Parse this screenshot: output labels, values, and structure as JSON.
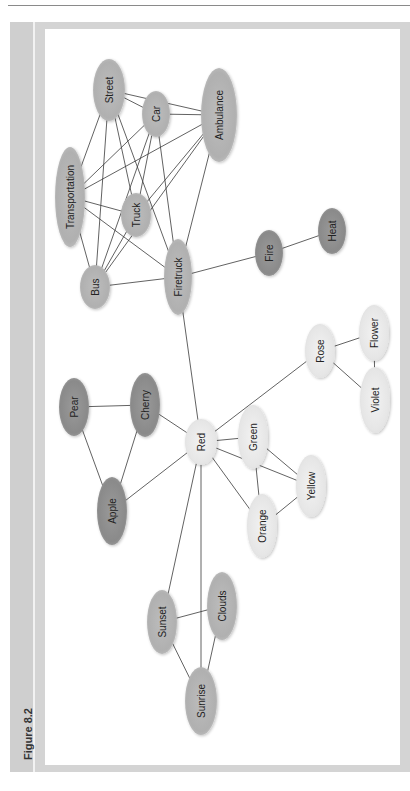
{
  "figure": {
    "title": "Figure 8.2"
  },
  "colors": {
    "frame": "#d4d4d4",
    "dark_node": "#8c8c8c",
    "medium_node": "#b4b4b4",
    "light_node": "#e8e8e8",
    "edge": "#3a3a3a"
  },
  "diagram": {
    "nodes": [
      {
        "id": "street",
        "label": "Street",
        "cx": 109,
        "cy": 90,
        "rx": 16,
        "ry": 31,
        "tone": "medium"
      },
      {
        "id": "car",
        "label": "Car",
        "cx": 156,
        "cy": 114,
        "rx": 14,
        "ry": 23,
        "tone": "medium"
      },
      {
        "id": "ambulance",
        "label": "Ambulance",
        "cx": 219,
        "cy": 115,
        "rx": 18,
        "ry": 47,
        "tone": "medium"
      },
      {
        "id": "transportation",
        "label": "Transportation",
        "cx": 70,
        "cy": 197,
        "rx": 15,
        "ry": 50,
        "tone": "medium"
      },
      {
        "id": "truck",
        "label": "Truck",
        "cx": 136,
        "cy": 215,
        "rx": 15,
        "ry": 22,
        "tone": "medium"
      },
      {
        "id": "bus",
        "label": "Bus",
        "cx": 95,
        "cy": 287,
        "rx": 15,
        "ry": 22,
        "tone": "medium"
      },
      {
        "id": "firetruck",
        "label": "Firetruck",
        "cx": 178,
        "cy": 277,
        "rx": 14,
        "ry": 38,
        "tone": "medium"
      },
      {
        "id": "fire",
        "label": "Fire",
        "cx": 269,
        "cy": 253,
        "rx": 14,
        "ry": 23,
        "tone": "dark"
      },
      {
        "id": "heat",
        "label": "Heat",
        "cx": 332,
        "cy": 231,
        "rx": 14,
        "ry": 23,
        "tone": "dark"
      },
      {
        "id": "rose",
        "label": "Rose",
        "cx": 320,
        "cy": 351,
        "rx": 15,
        "ry": 27,
        "tone": "light"
      },
      {
        "id": "flower",
        "label": "Flower",
        "cx": 374,
        "cy": 333,
        "rx": 15,
        "ry": 28,
        "tone": "light"
      },
      {
        "id": "violet",
        "label": "Violet",
        "cx": 375,
        "cy": 400,
        "rx": 15,
        "ry": 33,
        "tone": "light"
      },
      {
        "id": "pear",
        "label": "Pear",
        "cx": 74,
        "cy": 407,
        "rx": 15,
        "ry": 29,
        "tone": "dark"
      },
      {
        "id": "cherry",
        "label": "Cherry",
        "cx": 145,
        "cy": 405,
        "rx": 15,
        "ry": 32,
        "tone": "dark"
      },
      {
        "id": "red",
        "label": "Red",
        "cx": 201,
        "cy": 442,
        "rx": 16,
        "ry": 23,
        "tone": "light"
      },
      {
        "id": "green",
        "label": "Green",
        "cx": 253,
        "cy": 437,
        "rx": 15,
        "ry": 32,
        "tone": "light"
      },
      {
        "id": "apple",
        "label": "Apple",
        "cx": 112,
        "cy": 511,
        "rx": 15,
        "ry": 34,
        "tone": "dark"
      },
      {
        "id": "yellow",
        "label": "Yellow",
        "cx": 311,
        "cy": 486,
        "rx": 15,
        "ry": 31,
        "tone": "light"
      },
      {
        "id": "orange",
        "label": "Orange",
        "cx": 262,
        "cy": 526,
        "rx": 15,
        "ry": 32,
        "tone": "light"
      },
      {
        "id": "sunset",
        "label": "Sunset",
        "cx": 162,
        "cy": 622,
        "rx": 15,
        "ry": 32,
        "tone": "medium"
      },
      {
        "id": "clouds",
        "label": "Clouds",
        "cx": 222,
        "cy": 606,
        "rx": 15,
        "ry": 34,
        "tone": "medium"
      },
      {
        "id": "sunrise",
        "label": "Sunrise",
        "cx": 201,
        "cy": 701,
        "rx": 16,
        "ry": 34,
        "tone": "medium"
      }
    ],
    "edges": [
      [
        "street",
        "ambulance"
      ],
      [
        "street",
        "car"
      ],
      [
        "car",
        "ambulance"
      ],
      [
        "street",
        "transportation"
      ],
      [
        "street",
        "bus"
      ],
      [
        "street",
        "truck"
      ],
      [
        "street",
        "firetruck"
      ],
      [
        "car",
        "transportation"
      ],
      [
        "car",
        "bus"
      ],
      [
        "car",
        "truck"
      ],
      [
        "car",
        "firetruck"
      ],
      [
        "ambulance",
        "transportation"
      ],
      [
        "ambulance",
        "truck"
      ],
      [
        "ambulance",
        "bus"
      ],
      [
        "ambulance",
        "firetruck"
      ],
      [
        "transportation",
        "truck"
      ],
      [
        "transportation",
        "bus"
      ],
      [
        "transportation",
        "firetruck"
      ],
      [
        "truck",
        "bus"
      ],
      [
        "bus",
        "firetruck"
      ],
      [
        "firetruck",
        "fire"
      ],
      [
        "fire",
        "heat"
      ],
      [
        "firetruck",
        "red"
      ],
      [
        "red",
        "rose"
      ],
      [
        "rose",
        "flower"
      ],
      [
        "rose",
        "violet"
      ],
      [
        "flower",
        "violet"
      ],
      [
        "pear",
        "cherry"
      ],
      [
        "pear",
        "apple"
      ],
      [
        "cherry",
        "apple"
      ],
      [
        "cherry",
        "red"
      ],
      [
        "apple",
        "red"
      ],
      [
        "red",
        "green"
      ],
      [
        "red",
        "yellow"
      ],
      [
        "red",
        "orange"
      ],
      [
        "green",
        "yellow"
      ],
      [
        "green",
        "orange"
      ],
      [
        "orange",
        "yellow"
      ],
      [
        "red",
        "sunset"
      ],
      [
        "red",
        "sunrise"
      ],
      [
        "sunset",
        "clouds"
      ],
      [
        "sunset",
        "sunrise"
      ],
      [
        "clouds",
        "sunrise"
      ]
    ]
  }
}
